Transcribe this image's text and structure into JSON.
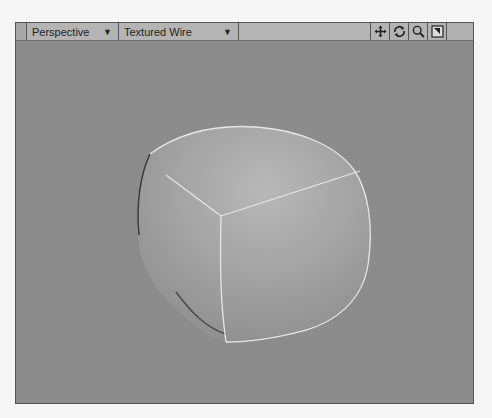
{
  "viewport": {
    "view_type": "Perspective",
    "render_mode": "Textured Wire",
    "dropdown_arrow": "▼",
    "tools": [
      {
        "name": "move-view",
        "icon": "move-icon"
      },
      {
        "name": "rotate-view",
        "icon": "rotate-icon"
      },
      {
        "name": "zoom-view",
        "icon": "zoom-icon"
      },
      {
        "name": "maximize-view",
        "icon": "maximize-icon"
      }
    ],
    "colors": {
      "background": "#8c8c8c",
      "toolbar": "#b4b4b4",
      "wire": "#e6e6e6"
    }
  },
  "scene": {
    "object": "subdivided cube (rounded)",
    "wireframe_edges": 3
  }
}
